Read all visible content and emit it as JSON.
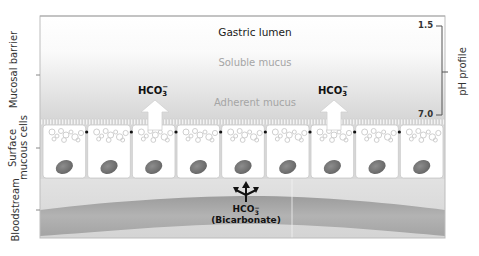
{
  "diagram": {
    "regions": {
      "lumen_label": "Gastric lumen",
      "soluble_mucus_label": "Soluble mucus",
      "adherent_mucus_label": "Adherent mucus"
    },
    "left_axis": {
      "mucosal_barrier": "Mucosal barrier",
      "surface_cells_line1": "Surface",
      "surface_cells_line2": "mucous cells",
      "bloodstream": "Bloodstream"
    },
    "ph_profile": {
      "label": "pH profile",
      "top_value": "1.5",
      "bottom_value": "7.0"
    },
    "secretion_arrows": [
      {
        "label": "HCO",
        "sub": "3",
        "sup": "−"
      },
      {
        "label": "HCO",
        "sub": "3",
        "sup": "−"
      }
    ],
    "bicarbonate": {
      "formula": "HCO",
      "sub": "3",
      "sup": "−",
      "name": "(Bicarbonate)"
    },
    "cell_count": 9,
    "colors": {
      "frame": "#b8b8b8",
      "mucus_light": "#f7f7f7",
      "mucus_dark": "#d9d9d9",
      "cell_fill": "#ffffff",
      "cell_border": "#c8c8c8",
      "nucleus": "#7a7a7a",
      "vesicle": "#cfcfcf",
      "blood_bg": "#dedede",
      "blood_vessel": "#a9a9a9",
      "arrow_fill": "#ffffff",
      "text_dark": "#111111",
      "text_muted": "#9a9a9a"
    }
  }
}
